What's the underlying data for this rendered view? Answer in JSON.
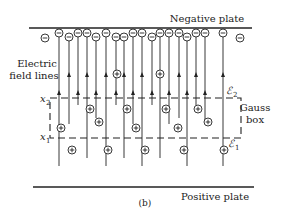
{
  "figure": {
    "caption": "(b)",
    "negative_plate_label": "Negative plate",
    "positive_plate_label": "Positive plate",
    "field_lines_label_line1": "Electric",
    "field_lines_label_line2": "field lines",
    "gauss_box_label_line1": "Gauss",
    "gauss_box_label_line2": "box",
    "x1_label": "x",
    "x1_sub": "1",
    "x2_label": "x",
    "x2_sub": "2",
    "e1_label": "ℰ",
    "e1_sub": "1",
    "e2_label": "ℰ",
    "e2_sub": "2",
    "negative_symbol": "−",
    "positive_symbol": "+",
    "colors": {
      "ink": "#222222",
      "background": "#ffffff"
    }
  }
}
